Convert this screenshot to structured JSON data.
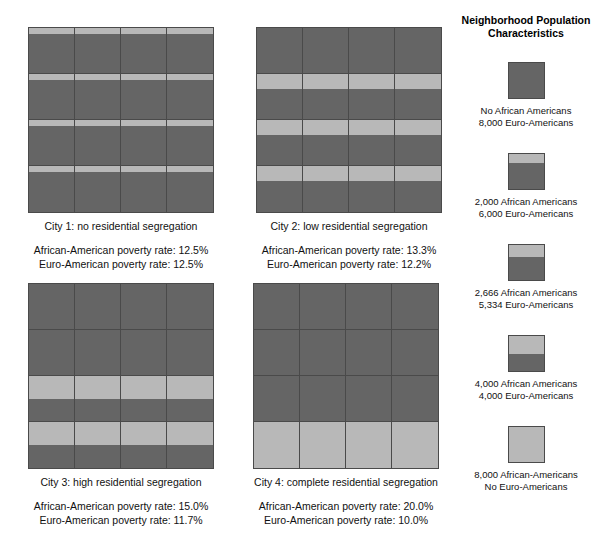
{
  "figure": {
    "background_color": "#ffffff",
    "dark_color": "#656565",
    "light_color": "#b8b8b8",
    "border_color": "#4a4a4a"
  },
  "legend": {
    "title_line1": "Neighborhood Population",
    "title_line2": "Characteristics",
    "items": [
      {
        "light_fraction": 0,
        "line1": "No African Americans",
        "line2": "8,000 Euro-Americans",
        "african_american": 0,
        "euro_american": 8000
      },
      {
        "light_fraction": 0.25,
        "line1": "2,000 African Americans",
        "line2": "6,000 Euro-Americans",
        "african_american": 2000,
        "euro_american": 6000
      },
      {
        "light_fraction": 0.3333,
        "line1": "2,666 African Americans",
        "line2": "5,334 Euro-Americans",
        "african_american": 2666,
        "euro_american": 5334
      },
      {
        "light_fraction": 0.5,
        "line1": "4,000 African Americans",
        "line2": "4,000 Euro-Americans",
        "african_american": 4000,
        "euro_american": 4000
      },
      {
        "light_fraction": 1,
        "line1": "8,000 African-Americans",
        "line2": "No Euro-Americans",
        "african_american": 8000,
        "euro_american": 0
      }
    ]
  },
  "cities": [
    {
      "id": "city-1",
      "caption": "City 1: no residential segregation",
      "african_american_rate_line": "African-American poverty rate:  12.5%",
      "euro_american_rate_line": "Euro-American poverty rate:  12.5%",
      "african_american_rate": "12.5%",
      "euro_american_rate": "12.5%",
      "row_light_fractions": [
        0.125,
        0.125,
        0.125,
        0.125
      ]
    },
    {
      "id": "city-2",
      "caption": "City 2: low residential segregation",
      "african_american_rate_line": "African-American poverty rate:  13.3%",
      "euro_american_rate_line": "Euro-American poverty rate:  12.2%",
      "african_american_rate": "13.3%",
      "euro_american_rate": "12.2%",
      "row_light_fractions": [
        0,
        0.3333,
        0.3333,
        0.3333
      ]
    },
    {
      "id": "city-3",
      "caption": "City 3: high residential segregation",
      "african_american_rate_line": "African-American poverty rate:  15.0%",
      "euro_american_rate_line": "Euro-American poverty rate:  11.7%",
      "african_american_rate": "15.0%",
      "euro_american_rate": "11.7%",
      "row_light_fractions": [
        0,
        0,
        0.5,
        0.5
      ]
    },
    {
      "id": "city-4",
      "caption": "City 4: complete residential segregation",
      "african_american_rate_line": "African-American poverty rate:  20.0%",
      "euro_american_rate_line": "Euro-American poverty rate:  10.0%",
      "african_american_rate": "20.0%",
      "euro_american_rate": "10.0%",
      "row_light_fractions": [
        0,
        0,
        0,
        1
      ]
    }
  ],
  "chart_data": {
    "type": "heatmap",
    "grid_rows": 4,
    "grid_cols": 4,
    "neighborhood_population": 8000,
    "legend_position": "right",
    "series": [
      {
        "name": "City 1: no residential segregation",
        "african_american_poverty_rate": 12.5,
        "euro_american_poverty_rate": 12.5,
        "rows_light_fraction": [
          0.125,
          0.125,
          0.125,
          0.125
        ]
      },
      {
        "name": "City 2: low residential segregation",
        "african_american_poverty_rate": 13.3,
        "euro_american_poverty_rate": 12.2,
        "rows_light_fraction": [
          0,
          0.3333,
          0.3333,
          0.3333
        ]
      },
      {
        "name": "City 3: high residential segregation",
        "african_american_poverty_rate": 15.0,
        "euro_american_poverty_rate": 11.7,
        "rows_light_fraction": [
          0,
          0,
          0.5,
          0.5
        ]
      },
      {
        "name": "City 4: complete residential segregation",
        "african_american_poverty_rate": 20.0,
        "euro_american_poverty_rate": 10.0,
        "rows_light_fraction": [
          0,
          0,
          0,
          1
        ]
      }
    ]
  }
}
